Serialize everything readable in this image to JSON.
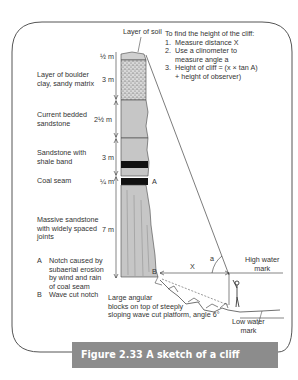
{
  "figure": {
    "number": "Figure 2.33",
    "title": "A sketch of a cliff profile",
    "caption": "Figure 2.33  A sketch of a cliff profile"
  },
  "colors": {
    "caption_bar": "#8c8c8c",
    "caption_text": "#ffffff",
    "rock_fill": "#c6c6c6",
    "coal_fill": "#111111",
    "frame": "#555555"
  },
  "top_label": "Layer of soil",
  "layers": [
    {
      "name": "soil",
      "label": "",
      "thickness": "½ m"
    },
    {
      "name": "boulder-clay",
      "label": "Layer of boulder\nclay, sandy matrix",
      "thickness": "3 m"
    },
    {
      "name": "current-bedded-sandstone",
      "label": "Current bedded\nsandstone",
      "thickness": "2½ m"
    },
    {
      "name": "sandstone-shale",
      "label": "Sandstone with\nshale band",
      "thickness": "3 m"
    },
    {
      "name": "coal-seam",
      "label": "Coal seam",
      "thickness": "¼ m"
    },
    {
      "name": "massive-sandstone",
      "label": "Massive sandstone\nwith widely spaced\njoints",
      "thickness": "7 m"
    }
  ],
  "instructions": {
    "heading": "To find the height of the cliff:",
    "steps": [
      {
        "num": "1.",
        "text": "Measure distance X"
      },
      {
        "num": "2.",
        "text": "Use a clinometer to\nmeasure angle a"
      },
      {
        "num": "3.",
        "text": "Height of cliff = (x × tan A)\n+ height of observer)"
      }
    ]
  },
  "notes": [
    {
      "key": "A",
      "text": "Notch caused by\nsubaerial erosion\nby wind and rain\nof coal seam"
    },
    {
      "key": "B",
      "text": "Wave cut notch"
    }
  ],
  "markers": {
    "a_point": "A",
    "b_point": "B",
    "distance": "X",
    "angle": "a"
  },
  "annotations": {
    "blocks": "Large angular\nblocks on top of steeply\nsloping wave cut platform, angle 6°",
    "high_water": "High water\nmark",
    "low_water": "Low water\nmark"
  }
}
